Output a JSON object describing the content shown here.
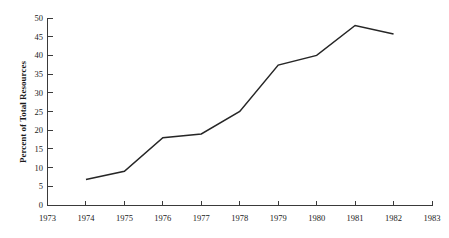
{
  "chart_data": {
    "type": "line",
    "title": "",
    "subtitle": "",
    "xlabel": "",
    "ylabel": "Percent of Total Resources",
    "x": [
      1974,
      1975,
      1976,
      1977,
      1978,
      1979,
      1980,
      1981,
      1982
    ],
    "values": [
      6.8,
      9,
      18,
      19,
      25,
      37.4,
      40,
      48,
      45.7
    ],
    "series": [
      {
        "name": "Percent of Total Resources",
        "values": [
          6.8,
          9,
          18,
          19,
          25,
          37.4,
          40,
          48,
          45.7
        ]
      }
    ],
    "xlim": [
      1973,
      1983
    ],
    "ylim": [
      0,
      50
    ],
    "x_tick_labels": [
      "1973",
      "1974",
      "1975",
      "1976",
      "1977",
      "1978",
      "1979",
      "1980",
      "1981",
      "1982",
      "1983"
    ],
    "x_ticks": [
      1973,
      1974,
      1975,
      1976,
      1977,
      1978,
      1979,
      1980,
      1981,
      1982,
      1983
    ],
    "y_tick_labels": [
      "0",
      "5",
      "10",
      "15",
      "20",
      "25",
      "30",
      "35",
      "40",
      "45",
      "50"
    ],
    "y_ticks": [
      0,
      5,
      10,
      15,
      20,
      25,
      30,
      35,
      40,
      45,
      50
    ],
    "grid": false,
    "legend": false,
    "legend_position": "none",
    "markers": false,
    "annotations": [],
    "colors": {
      "line": "#262626",
      "axis": "#3a3a3a",
      "text": "#1a1a1a",
      "background": "#ffffff"
    }
  }
}
